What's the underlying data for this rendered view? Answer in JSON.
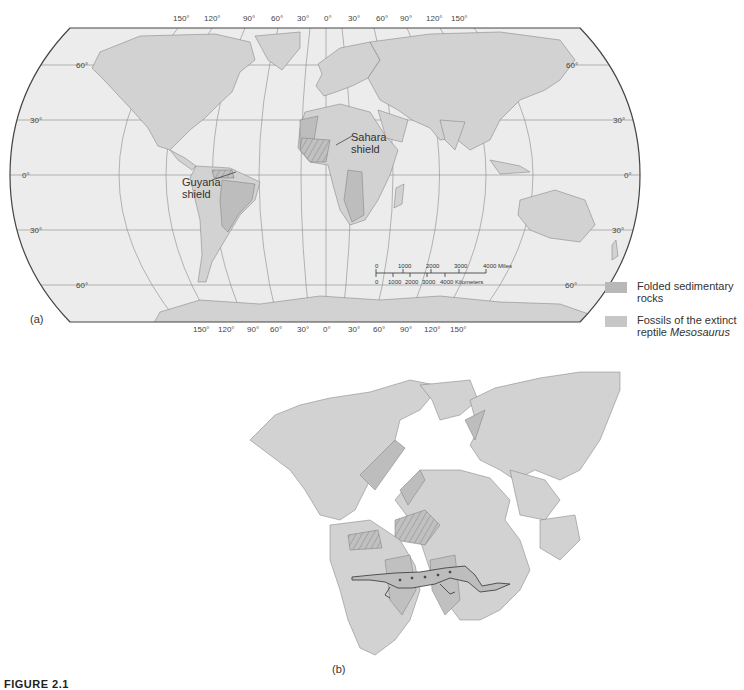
{
  "figure": {
    "caption": "FIGURE 2.1",
    "panel_a_label": "(a)",
    "panel_b_label": "(b)"
  },
  "map_a": {
    "longitude_ticks_top": [
      "150°",
      "120°",
      "90°",
      "60°",
      "30°",
      "0°",
      "30°",
      "60°",
      "90°",
      "120°",
      "150°"
    ],
    "longitude_ticks_bottom": [
      "150°",
      "120°",
      "90°",
      "60°",
      "30°",
      "0°",
      "30°",
      "60°",
      "90°",
      "120°",
      "150°"
    ],
    "latitude_ticks_left": [
      "60°",
      "30°",
      "0°",
      "30°",
      "60°"
    ],
    "latitude_ticks_right": [
      "60°",
      "30°",
      "0°",
      "30°",
      "60°"
    ],
    "annotations": {
      "sahara_line1": "Sahara",
      "sahara_line2": "shield",
      "guyana_line1": "Guyana",
      "guyana_line2": "shield"
    },
    "scale_bar": {
      "miles_ticks": [
        "0",
        "1000",
        "2000",
        "3000",
        "4000 Miles"
      ],
      "km_ticks": [
        "0",
        "1000",
        "2000",
        "3000",
        "4000 Kilometers"
      ]
    }
  },
  "legend": {
    "items": [
      {
        "line1": "Folded sedimentary",
        "line2": "rocks",
        "color": "#b8b8b8"
      },
      {
        "line1": "Fossils of the extinct",
        "line2_prefix": "reptile ",
        "line2_italic": "Mesosaurus",
        "color": "#c6c6c6"
      }
    ]
  },
  "colors": {
    "ocean": "#ececec",
    "land": "#d2d2d2",
    "folded_rocks": "#b8b8b8",
    "fossils": "#c4c4c4",
    "grid": "#8a8a8a",
    "outline": "#444444"
  }
}
